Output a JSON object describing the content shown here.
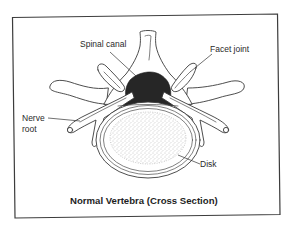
{
  "figure": {
    "caption": "Normal Vertebra (Cross Section)",
    "frame": {
      "stroke_color": "#3c3c3c",
      "background": "#ffffff"
    },
    "labels": {
      "spinal_canal": "Spinal canal",
      "facet_joint": "Facet joint",
      "nerve_root_line1": "Nerve",
      "nerve_root_line2": "root",
      "disk": "Disk"
    },
    "colors": {
      "spinal_canal_fill": "#262626",
      "bone_outline": "#3a3a3a",
      "disk_stipple": "#8a8a8a",
      "text": "#2a2a2a"
    }
  }
}
